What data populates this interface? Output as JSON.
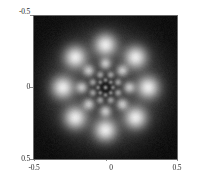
{
  "figure": {
    "title": "",
    "background_color": "#ffffff",
    "plot_background_color": "#000000",
    "frame_color": "#6a6a6a"
  },
  "axes": {
    "y_ticks": [
      {
        "label": "-0.5",
        "value": -0.5
      },
      {
        "label": "0",
        "value": 0
      },
      {
        "label": "0.5",
        "value": 0.5
      }
    ],
    "x_ticks": [
      {
        "label": "-0.5",
        "value": -0.5
      },
      {
        "label": "0",
        "value": 0
      },
      {
        "label": "0.5",
        "value": 0.5
      }
    ],
    "xlabel": "",
    "ylabel": ""
  },
  "chart_data": {
    "type": "heatmap",
    "title": "",
    "subtitle": "",
    "xlabel": "",
    "ylabel": "",
    "xlim": [
      -0.5,
      0.5
    ],
    "ylim": [
      -0.5,
      0.5
    ],
    "y_axis_inverted": true,
    "grid": false,
    "legend": "none",
    "colormap": "gray",
    "colormap_low": "#000000",
    "colormap_high": "#ffffff",
    "symmetry_order": 8,
    "rings": [
      {
        "name": "outer-ring",
        "radius": 0.3,
        "spot_count": 8,
        "spot_radius": 0.085,
        "peak_intensity": 1.0,
        "angles_deg": [
          0,
          45,
          90,
          135,
          180,
          225,
          270,
          315
        ]
      },
      {
        "name": "middle-ring",
        "radius": 0.165,
        "spot_count": 8,
        "spot_radius": 0.045,
        "peak_intensity": 0.72,
        "angles_deg": [
          0,
          45,
          90,
          135,
          180,
          225,
          270,
          315
        ]
      },
      {
        "name": "inner-ring",
        "radius": 0.095,
        "spot_count": 8,
        "spot_radius": 0.028,
        "peak_intensity": 0.58,
        "angles_deg": [
          22.5,
          67.5,
          112.5,
          157.5,
          202.5,
          247.5,
          292.5,
          337.5
        ]
      },
      {
        "name": "core-ring",
        "radius": 0.052,
        "spot_count": 8,
        "spot_radius": 0.017,
        "peak_intensity": 0.5,
        "angles_deg": [
          0,
          45,
          90,
          135,
          180,
          225,
          270,
          315
        ]
      },
      {
        "name": "central-peak",
        "radius": 0.0,
        "spot_count": 1,
        "spot_radius": 0.016,
        "peak_intensity": 0.62,
        "angles_deg": [
          0
        ]
      }
    ],
    "background_level": 0.04,
    "noise_amplitude": 0.045
  }
}
